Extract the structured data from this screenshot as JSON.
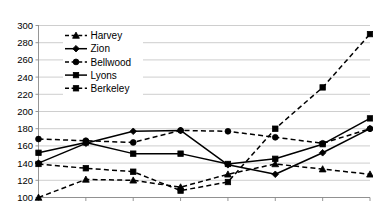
{
  "chart_data": {
    "type": "line",
    "title": "",
    "xlabel": "",
    "ylabel": "",
    "ylim": [
      100,
      300
    ],
    "ytick_labels": [
      "300",
      "280",
      "260",
      "240",
      "220",
      "200",
      "180",
      "160",
      "140",
      "120",
      "100"
    ],
    "ytick_values": [
      300,
      280,
      260,
      240,
      220,
      200,
      180,
      160,
      140,
      120,
      100
    ],
    "grid": true,
    "legend_position": "upper-left-inside",
    "x": [
      1,
      2,
      3,
      4,
      5,
      6,
      7,
      8
    ],
    "xtick_labels": [
      "",
      "",
      "",
      "",
      "",
      "",
      "",
      ""
    ],
    "series": [
      {
        "name": "Harvey",
        "values": [
          100,
          121,
          120,
          112,
          127,
          139,
          133,
          127
        ],
        "style": "dashed",
        "marker": "triangle"
      },
      {
        "name": "Zion",
        "values": [
          140,
          163,
          177,
          178,
          138,
          127,
          152,
          180
        ],
        "style": "solid",
        "marker": "diamond"
      },
      {
        "name": "Bellwood",
        "values": [
          168,
          166,
          164,
          178,
          177,
          170,
          163,
          180
        ],
        "style": "dashed",
        "marker": "circle"
      },
      {
        "name": "Lyons",
        "values": [
          152,
          164,
          151,
          151,
          139,
          145,
          162,
          192
        ],
        "style": "solid",
        "marker": "square"
      },
      {
        "name": "Berkeley",
        "values": [
          139,
          134,
          130,
          108,
          118,
          180,
          228,
          290
        ],
        "style": "dashed",
        "marker": "square"
      }
    ]
  },
  "legend": {
    "items": [
      {
        "label": "Harvey"
      },
      {
        "label": "Zion"
      },
      {
        "label": "Bellwood"
      },
      {
        "label": "Lyons"
      },
      {
        "label": "Berkeley"
      }
    ]
  }
}
